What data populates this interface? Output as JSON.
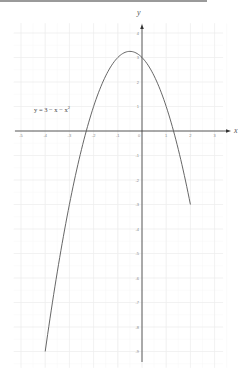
{
  "chart_data": {
    "type": "line",
    "title": "",
    "xlabel": "x",
    "ylabel": "y",
    "xlim": [
      -5.3,
      3.6
    ],
    "ylim": [
      -9.5,
      4.4
    ],
    "grid": true,
    "x_ticks": [
      -5,
      -4,
      -3,
      -2,
      -1,
      0,
      1,
      2,
      3
    ],
    "y_ticks": [
      4,
      3,
      2,
      1,
      0,
      -1,
      -2,
      -3,
      -4,
      -5,
      -6,
      -7,
      -8,
      -9
    ],
    "series": [
      {
        "name": "y = 3 − x − x²",
        "function": "3 - x - x^2",
        "domain": [
          -4,
          2
        ],
        "x": [
          -4,
          -3.5,
          -3,
          -2.5,
          -2,
          -1.5,
          -1,
          -0.5,
          0,
          0.5,
          1,
          1.5,
          2
        ],
        "y": [
          -9,
          -5.75,
          -3,
          -0.75,
          1,
          2.25,
          3,
          3.25,
          3,
          2.25,
          1,
          -0.75,
          -3
        ]
      }
    ],
    "annotations": [
      {
        "text": "y = 3 − x − x²",
        "x": -4.7,
        "y": 1.1
      }
    ]
  },
  "labels": {
    "x_axis": "x",
    "y_axis": "y",
    "equation_prefix": "y = 3 − x − x",
    "equation_exp": "2"
  },
  "layout": {
    "origin_px": [
      142,
      131
    ],
    "unit_x_px": 24.2,
    "unit_y_px": 24.5,
    "colors": {
      "grid": "#eeeeee",
      "grid_minor": "#f6f6f6",
      "axis": "#333333",
      "curve": "#555555"
    }
  }
}
